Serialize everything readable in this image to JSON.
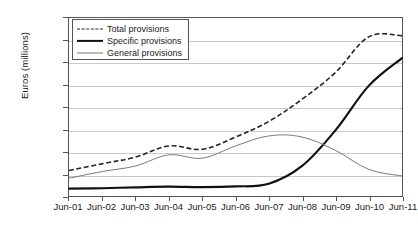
{
  "chart_data": {
    "type": "line",
    "title": "",
    "xlabel": "",
    "ylabel": "Euros (millions)",
    "grid": true,
    "legend_position": "top-left",
    "ylim": [
      0,
      80000
    ],
    "yticks": [
      0,
      10000,
      20000,
      30000,
      40000,
      50000,
      60000,
      70000,
      80000
    ],
    "ytick_labels": [
      "0",
      "10,000",
      "20,000",
      "30,000",
      "40,000",
      "50,000",
      "60,000",
      "70,000",
      "80,000"
    ],
    "categories": [
      "Jun-01",
      "Jun-02",
      "Jun-03",
      "Jun-04",
      "Jun-05",
      "Jun-06",
      "Jun-07",
      "Jun-08",
      "Jun-09",
      "Jun-10",
      "Jun-11"
    ],
    "series": [
      {
        "name": "Total provisions",
        "style": "dashed",
        "color": "#222222",
        "values": [
          11500,
          14500,
          17500,
          22500,
          21000,
          26500,
          33500,
          43500,
          55500,
          71500,
          72000
        ]
      },
      {
        "name": "Specific provisions",
        "style": "solid-thick",
        "color": "#111111",
        "values": [
          3300,
          3500,
          3900,
          4200,
          4000,
          4300,
          5500,
          13500,
          29500,
          49500,
          62000
        ]
      },
      {
        "name": "General provisions",
        "style": "solid-thin",
        "color": "#777777",
        "values": [
          8000,
          11000,
          13500,
          18500,
          17000,
          22500,
          27000,
          26500,
          20500,
          12000,
          9000
        ]
      }
    ]
  },
  "legend": {
    "items": [
      {
        "label": "Total provisions",
        "swatch": "dashed-line-swatch"
      },
      {
        "label": "Specific provisions",
        "swatch": "thick-solid-line-swatch"
      },
      {
        "label": "General provisions",
        "swatch": "thin-solid-line-swatch"
      }
    ]
  }
}
